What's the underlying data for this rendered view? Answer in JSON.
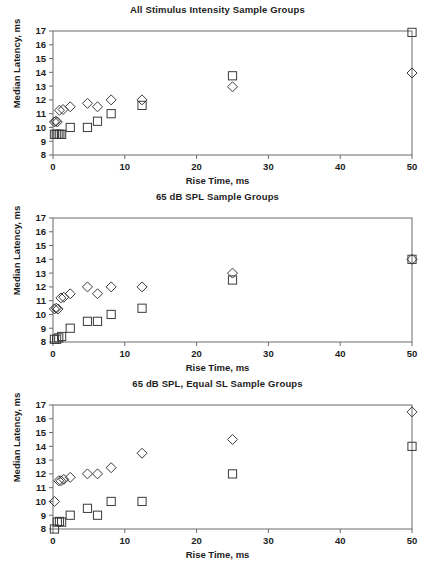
{
  "figure": {
    "xlabel": "Rise Time, ms",
    "ylabel": "Median Latency, ms",
    "xticks": [
      "0",
      "10",
      "20",
      "30",
      "40",
      "50"
    ],
    "yticks": [
      "8",
      "9",
      "10",
      "11",
      "12",
      "13",
      "14",
      "15",
      "16",
      "17"
    ],
    "axis_color": "#6b6b6b",
    "marker_color": "#3a3a3a"
  },
  "chart_data": [
    {
      "type": "scatter",
      "title": "All Stimulus Intensity Sample Groups",
      "xlabel": "Rise Time, ms",
      "ylabel": "Median Latency, ms",
      "xlim": [
        0,
        50
      ],
      "ylim": [
        8,
        17
      ],
      "xticks": [
        0,
        10,
        20,
        30,
        40,
        50
      ],
      "yticks": [
        8,
        9,
        10,
        11,
        12,
        13,
        14,
        15,
        16,
        17
      ],
      "grid": false,
      "legend": "none",
      "series": [
        {
          "name": "diamond",
          "marker": "diamond",
          "points": [
            [
              0.2,
              10.4
            ],
            [
              0.4,
              10.45
            ],
            [
              0.6,
              10.4
            ],
            [
              0.9,
              11.25
            ],
            [
              1.4,
              11.3
            ],
            [
              2.4,
              11.5
            ],
            [
              4.8,
              11.75
            ],
            [
              6.2,
              11.5
            ],
            [
              8.1,
              12.0
            ],
            [
              12.4,
              12.0
            ],
            [
              25.0,
              12.95
            ],
            [
              50.0,
              13.95
            ]
          ]
        },
        {
          "name": "square",
          "marker": "square",
          "points": [
            [
              0.2,
              9.5
            ],
            [
              0.45,
              9.5
            ],
            [
              0.7,
              9.5
            ],
            [
              0.95,
              9.5
            ],
            [
              1.2,
              9.5
            ],
            [
              2.4,
              10.0
            ],
            [
              4.8,
              10.0
            ],
            [
              6.2,
              10.45
            ],
            [
              8.1,
              11.0
            ],
            [
              12.4,
              11.6
            ],
            [
              25.0,
              13.75
            ],
            [
              50.0,
              16.9
            ]
          ]
        }
      ]
    },
    {
      "type": "scatter",
      "title": "65 dB SPL Sample Groups",
      "xlabel": "Rise Time, ms",
      "ylabel": "Median Latency, ms",
      "xlim": [
        0,
        50
      ],
      "ylim": [
        8,
        17
      ],
      "xticks": [
        0,
        10,
        20,
        30,
        40,
        50
      ],
      "yticks": [
        8,
        9,
        10,
        11,
        12,
        13,
        14,
        15,
        16,
        17
      ],
      "grid": false,
      "legend": "none",
      "series": [
        {
          "name": "diamond",
          "marker": "diamond",
          "points": [
            [
              0.2,
              10.4
            ],
            [
              0.45,
              10.45
            ],
            [
              0.7,
              10.4
            ],
            [
              1.1,
              11.2
            ],
            [
              1.5,
              11.25
            ],
            [
              2.4,
              11.5
            ],
            [
              4.8,
              12.0
            ],
            [
              6.2,
              11.5
            ],
            [
              8.1,
              12.0
            ],
            [
              12.4,
              12.0
            ],
            [
              25.0,
              13.0
            ],
            [
              50.0,
              14.0
            ]
          ]
        },
        {
          "name": "square",
          "marker": "square",
          "points": [
            [
              0.2,
              8.2
            ],
            [
              0.5,
              8.2
            ],
            [
              0.8,
              8.3
            ],
            [
              1.2,
              8.4
            ],
            [
              2.4,
              9.0
            ],
            [
              4.8,
              9.5
            ],
            [
              6.2,
              9.5
            ],
            [
              8.1,
              10.0
            ],
            [
              12.4,
              10.45
            ],
            [
              25.0,
              12.5
            ],
            [
              50.0,
              14.0
            ]
          ]
        }
      ]
    },
    {
      "type": "scatter",
      "title": "65 dB SPL, Equal SL Sample Groups",
      "xlabel": "Rise Time, ms",
      "ylabel": "Median Latency, ms",
      "xlim": [
        0,
        50
      ],
      "ylim": [
        8,
        17
      ],
      "xticks": [
        0,
        10,
        20,
        30,
        40,
        50
      ],
      "yticks": [
        8,
        9,
        10,
        11,
        12,
        13,
        14,
        15,
        16,
        17
      ],
      "grid": false,
      "legend": "none",
      "series": [
        {
          "name": "diamond",
          "marker": "diamond",
          "points": [
            [
              0.2,
              10.0
            ],
            [
              0.8,
              11.5
            ],
            [
              1.1,
              11.5
            ],
            [
              1.5,
              11.6
            ],
            [
              2.4,
              11.75
            ],
            [
              4.8,
              12.0
            ],
            [
              6.2,
              12.0
            ],
            [
              8.1,
              12.45
            ],
            [
              12.4,
              13.5
            ],
            [
              25.0,
              14.5
            ],
            [
              50.0,
              16.5
            ]
          ]
        },
        {
          "name": "square",
          "marker": "square",
          "points": [
            [
              0.2,
              8.0
            ],
            [
              0.6,
              8.5
            ],
            [
              0.9,
              8.55
            ],
            [
              1.2,
              8.5
            ],
            [
              2.4,
              9.0
            ],
            [
              4.8,
              9.5
            ],
            [
              6.2,
              9.0
            ],
            [
              8.1,
              10.0
            ],
            [
              12.4,
              10.0
            ],
            [
              25.0,
              12.0
            ],
            [
              50.0,
              14.0
            ]
          ]
        }
      ]
    }
  ]
}
